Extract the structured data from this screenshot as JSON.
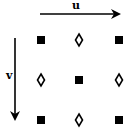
{
  "axes": {
    "u": {
      "label": "u",
      "direction": "right"
    },
    "v": {
      "label": "v",
      "direction": "down"
    }
  },
  "grid": {
    "rows": 3,
    "cols": 3,
    "cells": [
      [
        "square",
        "diamond",
        "square"
      ],
      [
        "diamond",
        "square",
        "diamond"
      ],
      [
        "square",
        "diamond",
        "square"
      ]
    ]
  },
  "colors": {
    "ink": "#000000",
    "background": "#ffffff"
  }
}
